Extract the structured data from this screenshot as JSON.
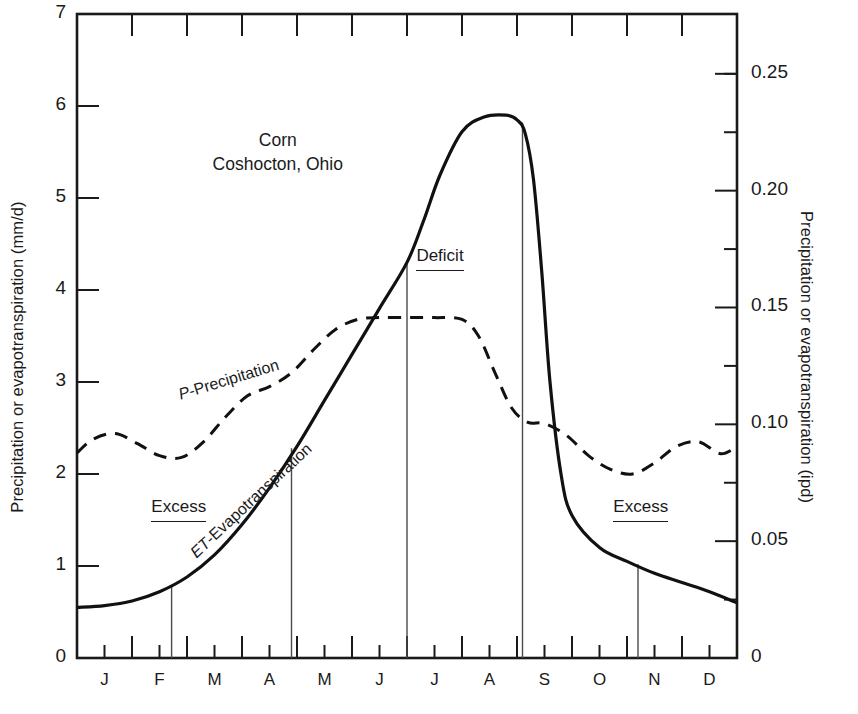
{
  "chart_data": {
    "type": "line",
    "title": "Corn",
    "subtitle": "Coshocton, Ohio",
    "xlabel": "",
    "ylabel": "Precipitation or evapotranspiration (mm/d)",
    "ylabel_right": "Precipitation or evapotranspiration (ipd)",
    "xlim": [
      0,
      12
    ],
    "ylim": [
      0,
      7
    ],
    "ylim_right": [
      0,
      0.2756
    ],
    "grid": false,
    "legend": "inline-curve-labels",
    "x_tick_labels": [
      "J",
      "F",
      "M",
      "A",
      "M",
      "J",
      "J",
      "A",
      "S",
      "O",
      "N",
      "D"
    ],
    "x_tick_positions": [
      0.5,
      1.5,
      2.5,
      3.5,
      4.5,
      5.5,
      6.5,
      7.5,
      8.5,
      9.5,
      10.5,
      11.5
    ],
    "y_tick_labels_left": [
      "0",
      "1",
      "2",
      "3",
      "4",
      "5",
      "6",
      "7"
    ],
    "y_tick_values_left": [
      0,
      1,
      2,
      3,
      4,
      5,
      6,
      7
    ],
    "y_tick_labels_right": [
      "0",
      "0.05",
      "0.10",
      "0.15",
      "0.20",
      "0.25"
    ],
    "y_tick_values_right": [
      0,
      0.05,
      0.1,
      0.15,
      0.2,
      0.25
    ],
    "y_minor_values_right": [
      0.025,
      0.075,
      0.125,
      0.175,
      0.225,
      0.25
    ],
    "series": [
      {
        "name": "ET-Evapotranspiration",
        "label": "ET-Evapotranspiration",
        "symbol": "ET",
        "suffix": "-Evapotranspiration",
        "style": "solid",
        "color": "#111111",
        "x": [
          0.0,
          0.5,
          1.0,
          1.5,
          2.0,
          2.5,
          3.0,
          3.5,
          4.0,
          4.5,
          5.0,
          5.5,
          6.0,
          6.3,
          6.6,
          7.0,
          7.4,
          7.8,
          8.0,
          8.15,
          8.3,
          8.45,
          8.6,
          8.8,
          9.0,
          9.5,
          10.0,
          10.5,
          11.0,
          11.5,
          12.0
        ],
        "y": [
          0.55,
          0.57,
          0.62,
          0.72,
          0.88,
          1.12,
          1.45,
          1.85,
          2.3,
          2.8,
          3.3,
          3.8,
          4.3,
          4.75,
          5.25,
          5.72,
          5.88,
          5.9,
          5.85,
          5.7,
          5.2,
          4.2,
          3.0,
          2.0,
          1.55,
          1.2,
          1.05,
          0.92,
          0.82,
          0.72,
          0.6
        ]
      },
      {
        "name": "P-Precipitation",
        "label": "P-Precipitation",
        "symbol": "P",
        "suffix": "-Precipitation",
        "style": "dashed",
        "color": "#111111",
        "x": [
          0.0,
          0.3,
          0.7,
          1.1,
          1.5,
          1.9,
          2.3,
          2.7,
          3.1,
          3.5,
          3.9,
          4.3,
          4.7,
          5.1,
          5.5,
          6.0,
          6.5,
          7.0,
          7.3,
          7.6,
          7.9,
          8.2,
          8.5,
          8.9,
          9.3,
          9.7,
          10.1,
          10.5,
          10.9,
          11.3,
          11.7,
          12.0
        ],
        "y": [
          2.23,
          2.38,
          2.44,
          2.33,
          2.2,
          2.18,
          2.35,
          2.62,
          2.85,
          2.95,
          3.1,
          3.35,
          3.57,
          3.68,
          3.7,
          3.7,
          3.7,
          3.68,
          3.5,
          3.1,
          2.72,
          2.56,
          2.55,
          2.42,
          2.2,
          2.05,
          2.0,
          2.12,
          2.3,
          2.35,
          2.22,
          2.3
        ]
      }
    ],
    "annotations": [
      {
        "text": "Excess",
        "x_value": 1.85,
        "y_value": 1.62,
        "underline": true,
        "region": "left"
      },
      {
        "text": "Deficit",
        "x_value": 6.6,
        "y_value": 4.35,
        "underline": true,
        "region": "middle"
      },
      {
        "text": "Excess",
        "x_value": 10.25,
        "y_value": 1.62,
        "underline": true,
        "region": "right"
      }
    ],
    "drop_lines": [
      {
        "x_value": 1.72,
        "y_top": 0.78
      },
      {
        "x_value": 3.9,
        "y_top": 2.28
      },
      {
        "x_value": 6.0,
        "y_top": 4.3
      },
      {
        "x_value": 8.1,
        "y_top": 5.82
      },
      {
        "x_value": 10.2,
        "y_top": 1.02
      }
    ],
    "colors": {
      "axis": "#1a1a1a",
      "et_curve": "#111111",
      "p_curve": "#111111",
      "drop_line": "#4a4a4a",
      "background": "#ffffff"
    }
  }
}
